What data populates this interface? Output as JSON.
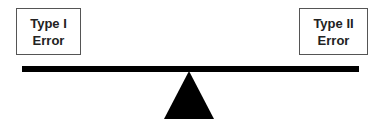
{
  "diagram": {
    "left_box": {
      "line1": "Type I",
      "line2": "Error"
    },
    "right_box": {
      "line1": "Type II",
      "line2": "Error"
    },
    "beam_color": "#000000",
    "fulcrum_color": "#000000"
  }
}
